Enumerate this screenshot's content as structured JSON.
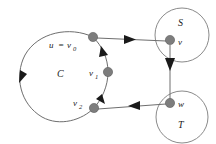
{
  "figure": {
    "background_color": "#ffffff",
    "node_color": "#7d7d7d",
    "curve_color": "#6e6e6e",
    "arrow_color": "#1a1a1a",
    "label_color": "#1a1a1a"
  },
  "labels": {
    "cycle": "C",
    "u_eq": "u",
    "u_equals_sign": "=",
    "v0": "v",
    "v0_sub": "0",
    "v1": "v",
    "v1_sub": "1",
    "v2": "v",
    "v2_sub": "2",
    "set_s": "S",
    "set_t": "T",
    "node_v": "v",
    "node_w": "w"
  },
  "nodes": [
    {
      "name": "v0",
      "label": "u = v0",
      "cx": 93,
      "cy": 37,
      "r": 4.6
    },
    {
      "name": "v1",
      "label": "v1",
      "cx": 108,
      "cy": 72,
      "r": 4.6
    },
    {
      "name": "v2",
      "label": "v2",
      "cx": 94,
      "cy": 108,
      "r": 4.6
    },
    {
      "name": "v",
      "label": "v",
      "cx": 170,
      "cy": 40,
      "r": 4.6
    },
    {
      "name": "w",
      "label": "w",
      "cx": 170,
      "cy": 103,
      "r": 4.6
    }
  ],
  "regions": [
    {
      "name": "S",
      "label": "S",
      "cx": 182,
      "cy": 35,
      "r": 27
    },
    {
      "name": "T",
      "label": "T",
      "cx": 182,
      "cy": 117,
      "r": 26
    }
  ],
  "edges": [
    {
      "name": "v0-to-v",
      "from": "v0",
      "to": "v",
      "direction": "right"
    },
    {
      "name": "v-to-w",
      "from": "v",
      "to": "w",
      "direction": "down"
    },
    {
      "name": "w-to-v2",
      "from": "w",
      "to": "v2",
      "direction": "left"
    },
    {
      "name": "cycle-arc",
      "from": "v0",
      "to": "v1",
      "direction": "clockwise"
    }
  ]
}
